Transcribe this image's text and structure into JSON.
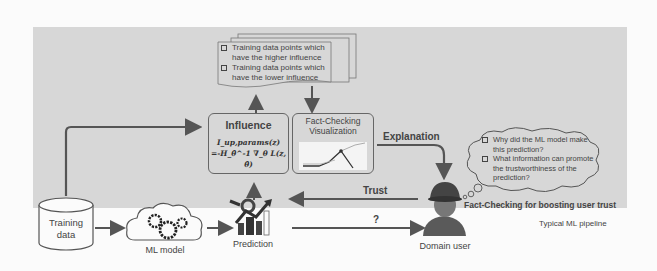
{
  "diagram": {
    "regions": {
      "fact_checking_panel": {
        "color": "#d7d7d7"
      }
    },
    "influence_list": {
      "items": [
        "Training data points which have the higher influence",
        "Training data points which have the lower influence"
      ]
    },
    "influence_box": {
      "title": "Influence",
      "formula_line1": "I_up,params(z)",
      "formula_line2": "=-H_θ̂^-1 ∇_θ L(z, θ̂)"
    },
    "visualization_box": {
      "title_line1": "Fact-Checking",
      "title_line2": "Visualization"
    },
    "edges": {
      "explanation": "Explanation",
      "trust": "Trust",
      "question": "?"
    },
    "thought_bubble": {
      "items": [
        "Why did the ML model make this prediction?",
        "What information can promote the trustworthiness of the prediction?"
      ]
    },
    "captions": {
      "fact_checking": "Fact-Checking for boosting user trust",
      "typical_pipeline": "Typical ML pipeline"
    },
    "nodes": {
      "training_data_line1": "Training",
      "training_data_line2": "data",
      "ml_model": "ML model",
      "prediction": "Prediction",
      "domain_user": "Domain user"
    }
  }
}
